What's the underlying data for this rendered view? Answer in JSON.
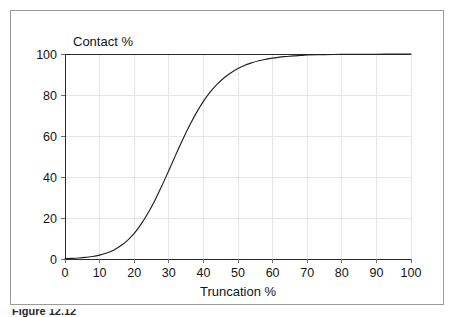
{
  "figure": {
    "border_color": "#9a9a9a",
    "background_color": "#ffffff",
    "caption_partial": "Figure 12.12"
  },
  "chart_data": {
    "type": "line",
    "title": "",
    "subtitle": "",
    "xlabel": "Truncation %",
    "ylabel": "Contact %",
    "ylabel_position": "top-left-inside",
    "xlim": [
      0,
      100
    ],
    "ylim": [
      0,
      100
    ],
    "xticks": [
      0,
      10,
      20,
      30,
      40,
      50,
      60,
      70,
      80,
      90,
      100
    ],
    "yticks": [
      0,
      20,
      40,
      60,
      80,
      100
    ],
    "xtick_labels": [
      "0",
      "10",
      "20",
      "30",
      "40",
      "50",
      "60",
      "70",
      "80",
      "90",
      "100"
    ],
    "ytick_labels": [
      "0",
      "20",
      "40",
      "60",
      "80",
      "100"
    ],
    "grid": true,
    "grid_color": "#e6e6e6",
    "legend": false,
    "legend_position": "none",
    "line_color": "#22201f",
    "series": [
      {
        "name": "Contact %",
        "x": [
          0,
          2,
          4,
          6,
          8,
          10,
          12,
          14,
          16,
          18,
          20,
          22,
          24,
          26,
          28,
          30,
          32,
          34,
          36,
          38,
          40,
          42,
          44,
          46,
          48,
          50,
          52,
          54,
          56,
          58,
          60,
          62,
          64,
          66,
          68,
          70,
          75,
          80,
          85,
          90,
          95,
          100
        ],
        "values": [
          0.2,
          0.3,
          0.5,
          0.8,
          1.2,
          1.9,
          2.9,
          4.3,
          6.3,
          9.0,
          12.5,
          17.0,
          22.4,
          28.7,
          35.7,
          43.2,
          50.8,
          58.2,
          65.1,
          71.4,
          76.9,
          81.5,
          85.3,
          88.4,
          90.9,
          92.9,
          94.5,
          95.7,
          96.7,
          97.4,
          98.0,
          98.5,
          98.8,
          99.1,
          99.3,
          99.5,
          99.7,
          99.8,
          99.9,
          99.9,
          100.0,
          100.0
        ]
      }
    ],
    "annotations": []
  }
}
